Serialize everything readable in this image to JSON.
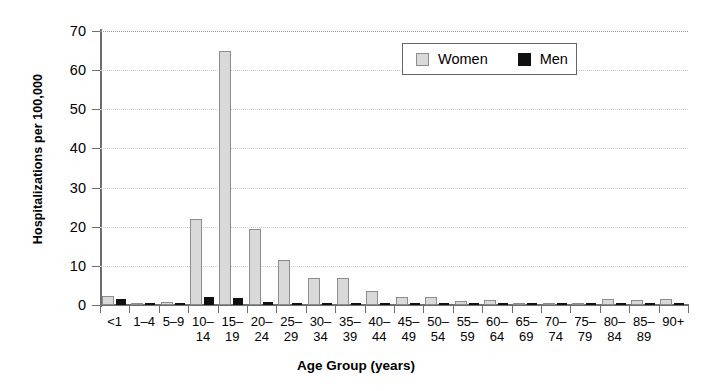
{
  "chart_data": {
    "type": "bar",
    "title": "",
    "xlabel": "Age Group (years)",
    "ylabel": "Hospitalizations per 100,000",
    "ylim": [
      0,
      70
    ],
    "yticks": [
      0,
      10,
      20,
      30,
      40,
      50,
      60,
      70
    ],
    "grid": true,
    "grid_axis": "y",
    "legend_position": "top-center-right",
    "categories": [
      "<1",
      "1–4",
      "5–9",
      "10–\n14",
      "15–\n19",
      "20–\n24",
      "25–\n29",
      "30–\n34",
      "35–\n39",
      "40–\n44",
      "45–\n49",
      "50–\n54",
      "55–\n59",
      "60–\n64",
      "65–\n69",
      "70–\n74",
      "75–\n79",
      "80–\n84",
      "85–\n89",
      "90+"
    ],
    "categories_plain": [
      "<1",
      "1-4",
      "5-9",
      "10-14",
      "15-19",
      "20-24",
      "25-29",
      "30-34",
      "35-39",
      "40-44",
      "45-49",
      "50-54",
      "55-59",
      "60-64",
      "65-69",
      "70-74",
      "75-79",
      "80-84",
      "85-89",
      "90+"
    ],
    "series": [
      {
        "name": "Women",
        "color": "#d9d9d9",
        "edge_color": "#8c8c8c",
        "values": [
          2.2,
          0.4,
          0.8,
          22.0,
          65.0,
          19.5,
          11.5,
          7.0,
          7.0,
          3.5,
          2.0,
          2.0,
          0.9,
          1.2,
          0.4,
          0.3,
          0.6,
          1.5,
          1.4,
          1.5
        ]
      },
      {
        "name": "Men",
        "color": "#101010",
        "edge_color": "#101010",
        "values": [
          1.5,
          0.3,
          0.3,
          2.1,
          1.9,
          0.8,
          0.5,
          0.5,
          0.5,
          0.4,
          0.3,
          0.3,
          0.3,
          0.2,
          0.3,
          0.5,
          0.6,
          0.4,
          0.2,
          0.0
        ]
      }
    ]
  },
  "legend": {
    "entries": [
      {
        "label": "Women",
        "swatch": "legend-swatch-women"
      },
      {
        "label": "Men",
        "swatch": "legend-swatch-men"
      }
    ]
  },
  "axes": {
    "y_title": "Hospitalizations per 100,000",
    "x_title": "Age Group (years)"
  }
}
